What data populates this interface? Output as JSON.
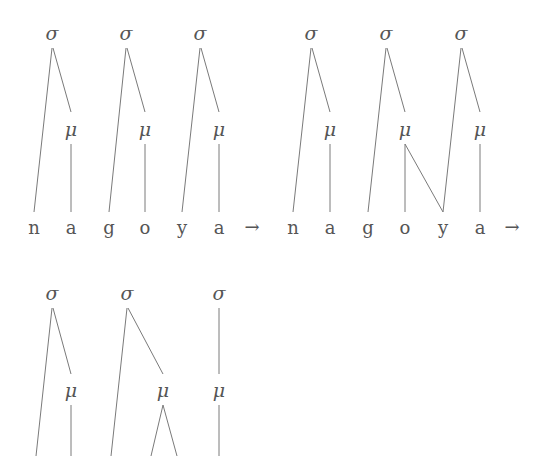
{
  "diagram": {
    "type": "prosodic-tree-derivation",
    "symbols": {
      "syllable": "σ",
      "mora": "μ",
      "arrow": "→"
    },
    "panels": [
      {
        "name": "stage-1",
        "segments": [
          "n",
          "a",
          "g",
          "o",
          "y",
          "a"
        ],
        "syllables": 3,
        "moras": 3,
        "associations": "each σ dominates onset consonant and μ; each μ dominates vowel"
      },
      {
        "name": "stage-2",
        "segments": [
          "n",
          "a",
          "g",
          "o",
          "y",
          "a"
        ],
        "syllables": 3,
        "moras": 3,
        "associations": "as stage-1, plus second μ links to y (ambisyllabic)"
      },
      {
        "name": "stage-3",
        "segments": [],
        "syllables": 3,
        "moras": 3,
        "associations": "third σ dominates only μ; second μ branches to two segments (cropped)"
      }
    ]
  },
  "nodes": {
    "sigma": "σ",
    "mu": "μ"
  },
  "row1": {
    "segments": [
      "n",
      "a",
      "g",
      "o",
      "y",
      "a",
      "→",
      "n",
      "a",
      "g",
      "o",
      "y",
      "a",
      "→"
    ]
  },
  "colors": {
    "ink": "#555555",
    "line": "#7a7a7a",
    "background": "#ffffff"
  }
}
